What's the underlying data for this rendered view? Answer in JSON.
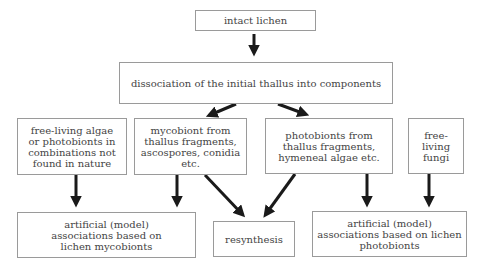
{
  "diagram": {
    "type": "flowchart",
    "nodes": {
      "intact": "intact lichen",
      "dissociation": "dissociation of the initial thallus into components",
      "free_algae": "free-living algae or photobionts in combinations not found in nature",
      "mycobiont": "mycobiont from thallus fragments, ascospores, conidia etc.",
      "photobionts": "photobionts from thallus fragments, hymeneal algae etc.",
      "free_fungi": "free-living fungi",
      "artificial_myco": "artificial (model) associations based on lichen mycobionts",
      "resynthesis": "resynthesis",
      "artificial_photo": "artificial (model) associations based on lichen photobionts"
    },
    "edges": [
      [
        "intact lichen",
        "dissociation of the initial thallus into components"
      ],
      [
        "dissociation of the initial thallus into components",
        "mycobiont from thallus fragments, ascospores, conidia etc."
      ],
      [
        "dissociation of the initial thallus into components",
        "photobionts from thallus fragments, hymeneal algae etc."
      ],
      [
        "free-living algae or photobionts in combinations not found in nature",
        "artificial (model) associations based on lichen mycobionts"
      ],
      [
        "mycobiont from thallus fragments, ascospores, conidia etc.",
        "artificial (model) associations based on lichen mycobionts"
      ],
      [
        "mycobiont from thallus fragments, ascospores, conidia etc.",
        "resynthesis"
      ],
      [
        "photobionts from thallus fragments, hymeneal algae etc.",
        "resynthesis"
      ],
      [
        "photobionts from thallus fragments, hymeneal algae etc.",
        "artificial (model) associations based on lichen photobionts"
      ],
      [
        "free-living fungi",
        "artificial (model) associations based on lichen photobionts"
      ]
    ],
    "colors": {
      "border": "#9a9a9a",
      "arrow": "#1a1a1a",
      "text": "#444444"
    }
  }
}
